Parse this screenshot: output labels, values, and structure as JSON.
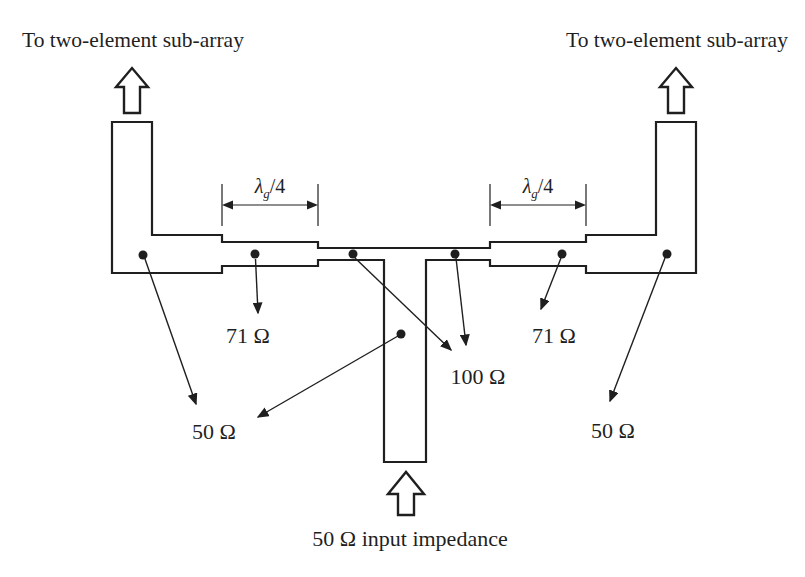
{
  "colors": {
    "background": "#ffffff",
    "ink": "#1f1f1f"
  },
  "labels": {
    "left_subarray": "To two-element sub-array",
    "right_subarray": "To two-element sub-array",
    "quarter_wave_left": {
      "lambda": "λ",
      "sub": "g",
      "frac": "/4"
    },
    "quarter_wave_right": {
      "lambda": "λ",
      "sub": "g",
      "frac": "/4"
    },
    "impedance_71_left": "71 Ω",
    "impedance_71_right": "71 Ω",
    "impedance_100": "100 Ω",
    "impedance_50_left": "50 Ω",
    "impedance_50_right": "50 Ω",
    "input_impedance": "50 Ω input impedance"
  }
}
